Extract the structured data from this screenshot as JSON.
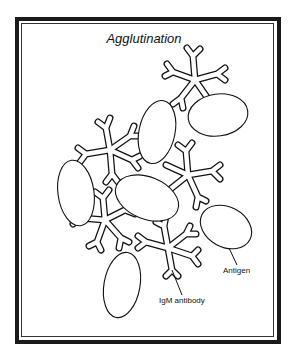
{
  "figure": {
    "title": "Agglutination",
    "labels": {
      "antigen": "Antigen",
      "igm_antibody": "IgM antibody"
    },
    "colors": {
      "frame": "#1a1a1a",
      "stroke": "#111111",
      "background": "#ffffff"
    },
    "elements": {
      "antigens": 7,
      "igm_antibodies": 5
    }
  }
}
